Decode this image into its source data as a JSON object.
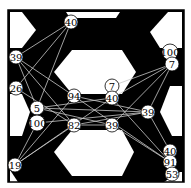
{
  "diagram": {
    "type": "graph-over-occupancy-map",
    "frame": {
      "x": 8,
      "y": 10,
      "width": 176,
      "height": 172
    },
    "colors": {
      "background": "#ffffff",
      "obstacle": "#000000",
      "free": "#ffffff",
      "edge": "#c8c8c8",
      "node_fill": "#ffffff",
      "node_stroke": "#000000"
    },
    "nodes": [
      {
        "id": "n0",
        "label": "40",
        "x": 71,
        "y": 22
      },
      {
        "id": "n1",
        "label": "39",
        "x": 16,
        "y": 57
      },
      {
        "id": "n2",
        "label": "26",
        "x": 16,
        "y": 88
      },
      {
        "id": "n3",
        "label": "5",
        "x": 37,
        "y": 108
      },
      {
        "id": "n4",
        "label": "100",
        "x": 37,
        "y": 123
      },
      {
        "id": "n5",
        "label": "19",
        "x": 15,
        "y": 165
      },
      {
        "id": "n6",
        "label": "94",
        "x": 74,
        "y": 96
      },
      {
        "id": "n7",
        "label": "82",
        "x": 74,
        "y": 125
      },
      {
        "id": "n8",
        "label": "7",
        "x": 112,
        "y": 86
      },
      {
        "id": "n9",
        "label": "40",
        "x": 112,
        "y": 98
      },
      {
        "id": "n10",
        "label": "39",
        "x": 112,
        "y": 125
      },
      {
        "id": "n11",
        "label": "39",
        "x": 148,
        "y": 112
      },
      {
        "id": "n12",
        "label": "100",
        "x": 170,
        "y": 52
      },
      {
        "id": "n13",
        "label": "7",
        "x": 172,
        "y": 64
      },
      {
        "id": "n14",
        "label": "40",
        "x": 170,
        "y": 151
      },
      {
        "id": "n15",
        "label": "91",
        "x": 170,
        "y": 162
      },
      {
        "id": "n16",
        "label": "53",
        "x": 172,
        "y": 174
      }
    ],
    "edges": [
      [
        "n0",
        "n1"
      ],
      [
        "n0",
        "n2"
      ],
      [
        "n0",
        "n3"
      ],
      [
        "n1",
        "n6"
      ],
      [
        "n1",
        "n7"
      ],
      [
        "n1",
        "n3"
      ],
      [
        "n2",
        "n7"
      ],
      [
        "n3",
        "n11"
      ],
      [
        "n3",
        "n10"
      ],
      [
        "n3",
        "n9"
      ],
      [
        "n6",
        "n11"
      ],
      [
        "n6",
        "n5"
      ],
      [
        "n7",
        "n11"
      ],
      [
        "n7",
        "n5"
      ],
      [
        "n7",
        "n10"
      ],
      [
        "n4",
        "n11"
      ],
      [
        "n5",
        "n9"
      ],
      [
        "n5",
        "n4"
      ],
      [
        "n9",
        "n13"
      ],
      [
        "n9",
        "n15"
      ],
      [
        "n10",
        "n13"
      ],
      [
        "n10",
        "n15"
      ],
      [
        "n11",
        "n13"
      ],
      [
        "n11",
        "n14"
      ],
      [
        "n6",
        "n15"
      ],
      [
        "n8",
        "n13"
      ]
    ]
  }
}
